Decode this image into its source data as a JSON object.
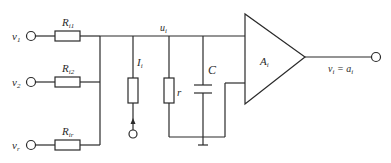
{
  "diagram": {
    "type": "circuit",
    "inputs": [
      {
        "label": "v",
        "sub": "1"
      },
      {
        "label": "v",
        "sub": "2"
      },
      {
        "label": "v",
        "sub": "r"
      }
    ],
    "input_resistors": [
      {
        "label": "R",
        "sub": "i1"
      },
      {
        "label": "R",
        "sub": "i2"
      },
      {
        "label": "R",
        "sub": "ir"
      }
    ],
    "node": {
      "label": "u",
      "sub": "i"
    },
    "current_source": {
      "label": "I",
      "sub": "i"
    },
    "shunt_resistor": {
      "label": "r"
    },
    "capacitor": {
      "label": "C"
    },
    "amplifier": {
      "label": "A",
      "sub": "i"
    },
    "output": {
      "label": "v",
      "sub": "i",
      "eq": " = a",
      "eq_sub": "i"
    }
  }
}
